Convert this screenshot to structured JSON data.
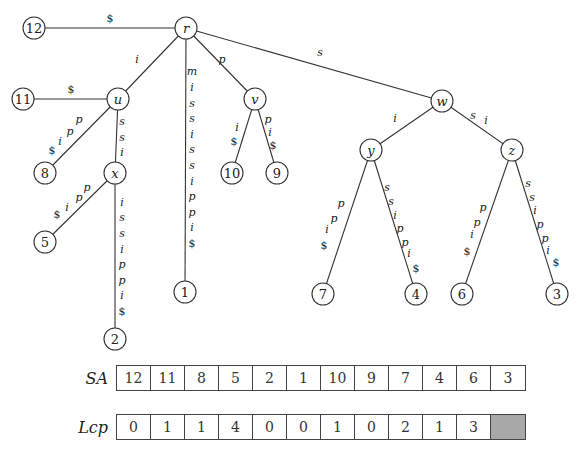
{
  "diagram": {
    "nodes": [
      {
        "id": "r",
        "label": "r",
        "type": "internal",
        "x": 186,
        "y": 28
      },
      {
        "id": "l12",
        "label": "12",
        "type": "leaf",
        "x": 34,
        "y": 28
      },
      {
        "id": "u",
        "label": "u",
        "type": "internal",
        "x": 118,
        "y": 99
      },
      {
        "id": "l11",
        "label": "11",
        "type": "leaf",
        "x": 23,
        "y": 99
      },
      {
        "id": "l8",
        "label": "8",
        "type": "leaf",
        "x": 45,
        "y": 173
      },
      {
        "id": "x",
        "label": "x",
        "type": "internal",
        "x": 115,
        "y": 173
      },
      {
        "id": "l5",
        "label": "5",
        "type": "leaf",
        "x": 45,
        "y": 242
      },
      {
        "id": "l2",
        "label": "2",
        "type": "leaf",
        "x": 115,
        "y": 339
      },
      {
        "id": "l1",
        "label": "1",
        "type": "leaf",
        "x": 185,
        "y": 292
      },
      {
        "id": "v",
        "label": "v",
        "type": "internal",
        "x": 255,
        "y": 99
      },
      {
        "id": "l10",
        "label": "10",
        "type": "leaf",
        "x": 232,
        "y": 173
      },
      {
        "id": "l9",
        "label": "9",
        "type": "leaf",
        "x": 277,
        "y": 173
      },
      {
        "id": "w",
        "label": "w",
        "type": "internal",
        "x": 442,
        "y": 101
      },
      {
        "id": "y",
        "label": "y",
        "type": "internal",
        "x": 371,
        "y": 150
      },
      {
        "id": "z",
        "label": "z",
        "type": "internal",
        "x": 512,
        "y": 150
      },
      {
        "id": "l7",
        "label": "7",
        "type": "leaf",
        "x": 323,
        "y": 294
      },
      {
        "id": "l4",
        "label": "4",
        "type": "leaf",
        "x": 416,
        "y": 294
      },
      {
        "id": "l6",
        "label": "6",
        "type": "leaf",
        "x": 462,
        "y": 294
      },
      {
        "id": "l3",
        "label": "3",
        "type": "leaf",
        "x": 557,
        "y": 294
      }
    ],
    "edges": [
      {
        "from": "r",
        "to": "l12",
        "label": "$",
        "chars": [
          {
            "c": "$",
            "x": 110,
            "y": 18
          }
        ]
      },
      {
        "from": "r",
        "to": "u",
        "label": "i",
        "chars": [
          {
            "c": "i",
            "x": 137,
            "y": 59
          }
        ]
      },
      {
        "from": "r",
        "to": "l1",
        "label": "mississippi$",
        "chars": [
          {
            "c": "m",
            "x": 192,
            "y": 71
          },
          {
            "c": "i",
            "x": 192,
            "y": 87
          },
          {
            "c": "s",
            "x": 192,
            "y": 103
          },
          {
            "c": "s",
            "x": 192,
            "y": 118
          },
          {
            "c": "i",
            "x": 192,
            "y": 134
          },
          {
            "c": "s",
            "x": 192,
            "y": 149
          },
          {
            "c": "s",
            "x": 192,
            "y": 165
          },
          {
            "c": "i",
            "x": 192,
            "y": 181
          },
          {
            "c": "p",
            "x": 192,
            "y": 196
          },
          {
            "c": "p",
            "x": 192,
            "y": 212
          },
          {
            "c": "i",
            "x": 192,
            "y": 227
          },
          {
            "c": "$",
            "x": 192,
            "y": 243
          }
        ]
      },
      {
        "from": "r",
        "to": "v",
        "label": "p",
        "chars": [
          {
            "c": "p",
            "x": 222,
            "y": 59
          }
        ]
      },
      {
        "from": "r",
        "to": "w",
        "label": "s",
        "chars": [
          {
            "c": "s",
            "x": 320,
            "y": 52
          }
        ]
      },
      {
        "from": "u",
        "to": "l11",
        "label": "$",
        "chars": [
          {
            "c": "$",
            "x": 71,
            "y": 89
          }
        ]
      },
      {
        "from": "u",
        "to": "l8",
        "label": "ppi$",
        "chars": [
          {
            "c": "p",
            "x": 79,
            "y": 119
          },
          {
            "c": "p",
            "x": 70,
            "y": 131
          },
          {
            "c": "i",
            "x": 60,
            "y": 141
          },
          {
            "c": "$",
            "x": 52,
            "y": 150
          }
        ]
      },
      {
        "from": "u",
        "to": "x",
        "label": "ssi",
        "chars": [
          {
            "c": "s",
            "x": 122,
            "y": 121
          },
          {
            "c": "s",
            "x": 122,
            "y": 137
          },
          {
            "c": "i",
            "x": 122,
            "y": 152
          }
        ]
      },
      {
        "from": "x",
        "to": "l5",
        "label": "ppi$",
        "chars": [
          {
            "c": "p",
            "x": 87,
            "y": 187
          },
          {
            "c": "p",
            "x": 79,
            "y": 197
          },
          {
            "c": "i",
            "x": 67,
            "y": 207
          },
          {
            "c": "$",
            "x": 57,
            "y": 214
          }
        ]
      },
      {
        "from": "x",
        "to": "l2",
        "label": "ississippi$",
        "chars": [
          {
            "c": "i",
            "x": 122,
            "y": 202
          },
          {
            "c": "s",
            "x": 122,
            "y": 217
          },
          {
            "c": "s",
            "x": 122,
            "y": 233
          },
          {
            "c": "i",
            "x": 122,
            "y": 249
          },
          {
            "c": "p",
            "x": 122,
            "y": 264
          },
          {
            "c": "p",
            "x": 122,
            "y": 280
          },
          {
            "c": "i",
            "x": 122,
            "y": 295
          },
          {
            "c": "$",
            "x": 122,
            "y": 311
          }
        ]
      },
      {
        "from": "v",
        "to": "l10",
        "label": "i$",
        "chars": [
          {
            "c": "i",
            "x": 237,
            "y": 127
          },
          {
            "c": "$",
            "x": 234,
            "y": 141
          }
        ]
      },
      {
        "from": "v",
        "to": "l9",
        "label": "pi$",
        "chars": [
          {
            "c": "p",
            "x": 268,
            "y": 119
          },
          {
            "c": "i",
            "x": 270,
            "y": 132
          },
          {
            "c": "$",
            "x": 273,
            "y": 145
          }
        ]
      },
      {
        "from": "w",
        "to": "y",
        "label": "i",
        "chars": [
          {
            "c": "i",
            "x": 395,
            "y": 118
          }
        ]
      },
      {
        "from": "w",
        "to": "z",
        "label": "si",
        "chars": [
          {
            "c": "s",
            "x": 473,
            "y": 115
          },
          {
            "c": "i",
            "x": 486,
            "y": 120
          }
        ]
      },
      {
        "from": "y",
        "to": "l7",
        "label": "ppi$",
        "chars": [
          {
            "c": "p",
            "x": 341,
            "y": 203
          },
          {
            "c": "p",
            "x": 334,
            "y": 218
          },
          {
            "c": "i",
            "x": 327,
            "y": 229
          },
          {
            "c": "$",
            "x": 324,
            "y": 245
          }
        ]
      },
      {
        "from": "y",
        "to": "l4",
        "label": "ssippi$",
        "chars": [
          {
            "c": "s",
            "x": 387,
            "y": 187
          },
          {
            "c": "s",
            "x": 391,
            "y": 201
          },
          {
            "c": "i",
            "x": 395,
            "y": 215
          },
          {
            "c": "p",
            "x": 400,
            "y": 228
          },
          {
            "c": "p",
            "x": 405,
            "y": 242
          },
          {
            "c": "i",
            "x": 409,
            "y": 253
          },
          {
            "c": "$",
            "x": 416,
            "y": 268
          }
        ]
      },
      {
        "from": "z",
        "to": "l6",
        "label": "ppi$",
        "chars": [
          {
            "c": "p",
            "x": 483,
            "y": 207
          },
          {
            "c": "p",
            "x": 477,
            "y": 222
          },
          {
            "c": "i",
            "x": 472,
            "y": 234
          },
          {
            "c": "$",
            "x": 467,
            "y": 251
          }
        ]
      },
      {
        "from": "z",
        "to": "l3",
        "label": "ssippi$",
        "chars": [
          {
            "c": "s",
            "x": 528,
            "y": 183
          },
          {
            "c": "s",
            "x": 532,
            "y": 197
          },
          {
            "c": "i",
            "x": 535,
            "y": 210
          },
          {
            "c": "p",
            "x": 540,
            "y": 224
          },
          {
            "c": "p",
            "x": 545,
            "y": 238
          },
          {
            "c": "i",
            "x": 548,
            "y": 250
          },
          {
            "c": "$",
            "x": 556,
            "y": 262
          }
        ]
      }
    ],
    "node_radius": 11
  },
  "arrays": {
    "sa": {
      "name": "SA",
      "values": [
        "12",
        "11",
        "8",
        "5",
        "2",
        "1",
        "10",
        "9",
        "7",
        "4",
        "6",
        "3"
      ]
    },
    "lcp": {
      "name": "Lcp",
      "values": [
        "0",
        "1",
        "1",
        "4",
        "0",
        "0",
        "1",
        "0",
        "2",
        "1",
        "3",
        ""
      ],
      "shaded_last": true,
      "shade_color": "#a8a8a8"
    }
  }
}
